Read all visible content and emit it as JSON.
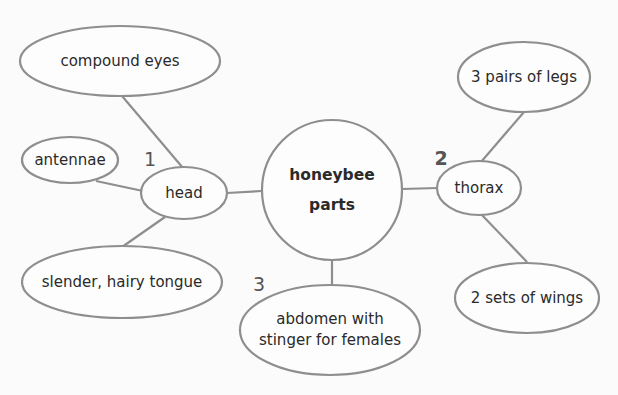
{
  "diagram": {
    "center": {
      "label_line1": "honeybee",
      "label_line2": "parts"
    },
    "branches": [
      {
        "number": "1",
        "label": "head",
        "details": [
          "compound eyes",
          "antennae",
          "slender, hairy tongue"
        ]
      },
      {
        "number": "2",
        "label": "thorax",
        "details": [
          "3 pairs of legs",
          "2 sets of wings"
        ]
      },
      {
        "number": "3",
        "label": "abdomen with stinger for females",
        "label_line1": "abdomen with",
        "label_line2": "stinger for females",
        "details": []
      }
    ]
  },
  "colors": {
    "stroke": "#8e8e8e",
    "text": "#2a2a2a",
    "background": "#fbfbfb"
  }
}
